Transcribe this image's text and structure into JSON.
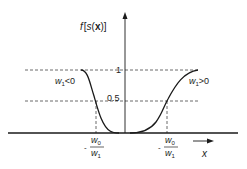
{
  "diagram": {
    "y_axis_label": {
      "f": "f",
      "open": "[",
      "s": "s",
      "paren_open": "(",
      "x": "x",
      "paren_close": ")",
      "close": "]"
    },
    "x_axis_label": "x",
    "tick_one": "1",
    "tick_half": "0.5",
    "curve_left_label": {
      "w": "w",
      "sub": "1",
      "rel": "<0"
    },
    "curve_right_label": {
      "w": "w",
      "sub": "1",
      "rel": ">0"
    },
    "threshold_left": {
      "minus": "-",
      "num_w": "w",
      "num_sub": "0",
      "den_w": "w",
      "den_sub": "1"
    },
    "threshold_right": {
      "minus": "-",
      "num_w": "w",
      "num_sub": "0",
      "den_w": "w",
      "den_sub": "1"
    },
    "colors": {
      "line": "#1a1a1a",
      "dashed": "#444444",
      "text": "#222222"
    }
  }
}
